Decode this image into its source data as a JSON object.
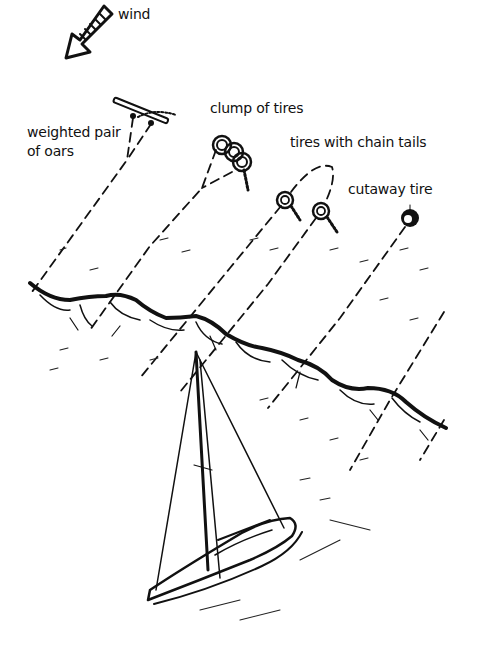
{
  "diagram": {
    "type": "annotated illustration",
    "labels": {
      "wind": "wind",
      "oars_line1": "weighted pair",
      "oars_line2": "of oars",
      "clump": "clump of tires",
      "chain_tails": "tires with chain tails",
      "cutaway": "cutaway tire"
    },
    "elements": [
      {
        "name": "wind-arrow",
        "direction": "down-left"
      },
      {
        "name": "weighted-pair-of-oars"
      },
      {
        "name": "clump-of-tires"
      },
      {
        "name": "tires-with-chain-tails",
        "count": 2
      },
      {
        "name": "cutaway-tire"
      },
      {
        "name": "wave-crest"
      },
      {
        "name": "sailboat"
      }
    ],
    "colors": {
      "ink": "#111111",
      "background": "#ffffff"
    }
  }
}
